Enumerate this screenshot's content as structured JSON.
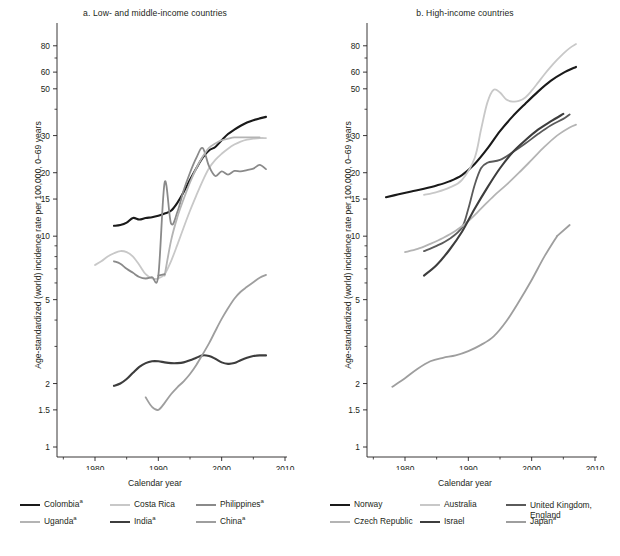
{
  "figure": {
    "width": 620,
    "height": 556,
    "background": "#ffffff",
    "ink": "#231f20"
  },
  "axis": {
    "xlabel": "Calendar year",
    "ylabel": "Age-standardized (world) incidence rate per 100,000, 0–69 years",
    "x_ticks_major": [
      1980,
      1990,
      2000,
      2010
    ],
    "x_ticks_minor": [
      1975,
      1985,
      1995,
      2005
    ],
    "x_tick_labels": [
      "1980",
      "1990",
      "2000",
      "2010"
    ],
    "xlim": [
      1974,
      2010
    ],
    "y_tick_labels": [
      "80",
      "60",
      "50",
      "30",
      "20",
      "15",
      "10",
      "5",
      "2",
      "1.5",
      "1"
    ],
    "y_ticks_major": [
      80,
      60,
      50,
      30,
      20,
      15,
      10,
      5,
      2,
      1.5,
      1
    ],
    "y_ticks_minor": [
      70,
      40,
      9,
      8,
      7,
      6,
      4,
      3
    ],
    "ylim": [
      1,
      90
    ],
    "yscale": "log",
    "grid": false
  },
  "panels": [
    {
      "id": "a",
      "title": "a. Low- and middle-income countries",
      "legend": [
        {
          "label": "Colombia",
          "superscript": "a",
          "color": "#1a1a1a",
          "width": 2.2
        },
        {
          "label": "Costa Rica",
          "superscript": "",
          "color": "#c8c8c8",
          "width": 2.0
        },
        {
          "label": "Philippines",
          "superscript": "a",
          "color": "#8a8a8a",
          "width": 2.0
        },
        {
          "label": "Uganda",
          "superscript": "a",
          "color": "#b4b4b4",
          "width": 2.0
        },
        {
          "label": "India",
          "superscript": "a",
          "color": "#3d3d3d",
          "width": 2.2
        },
        {
          "label": "China",
          "superscript": "a",
          "color": "#9e9e9e",
          "width": 2.0
        }
      ]
    },
    {
      "id": "b",
      "title": "b. High-income countries",
      "legend": [
        {
          "label": "Norway",
          "superscript": "",
          "color": "#1a1a1a",
          "width": 2.2
        },
        {
          "label": "Australia",
          "superscript": "",
          "color": "#c8c8c8",
          "width": 2.0
        },
        {
          "label": "United Kingdom, England",
          "superscript": "",
          "color": "#5a5a5a",
          "width": 2.0
        },
        {
          "label": "Czech Republic",
          "superscript": "",
          "color": "#b4b4b4",
          "width": 2.0
        },
        {
          "label": "Israel",
          "superscript": "",
          "color": "#3d3d3d",
          "width": 2.2
        },
        {
          "label": "Japan",
          "superscript": "a",
          "color": "#9e9e9e",
          "width": 2.0
        }
      ]
    }
  ],
  "chart_data": [
    {
      "panel": "a",
      "type": "line",
      "title": "a. Low- and middle-income countries",
      "xlabel": "Calendar year",
      "ylabel": "Age-standardized (world) incidence rate per 100,000, 0–69 years",
      "yscale": "log",
      "xlim": [
        1974,
        2010
      ],
      "ylim": [
        1,
        90
      ],
      "legend_position": "below",
      "series": [
        {
          "name": "Colombia",
          "color": "#1a1a1a",
          "x": [
            1983,
            1984,
            1985,
            1986,
            1987,
            1988,
            1989,
            1990,
            1991,
            1992,
            1993,
            1994,
            1995,
            1996,
            1997,
            1998,
            1999,
            2000,
            2001,
            2002,
            2003,
            2004,
            2005,
            2006,
            2007
          ],
          "y": [
            11.2,
            11.3,
            11.6,
            12.2,
            12.0,
            12.2,
            12.3,
            12.5,
            12.8,
            13.2,
            14.4,
            16.2,
            18.5,
            21.0,
            23.6,
            25.5,
            26.5,
            28.5,
            30.5,
            32.0,
            33.4,
            34.6,
            35.5,
            36.2,
            36.8
          ]
        },
        {
          "name": "Costa Rica",
          "color": "#c8c8c8",
          "x": [
            1980,
            1981,
            1982,
            1983,
            1984,
            1985,
            1986,
            1987,
            1988,
            1989,
            1990,
            1991,
            1992,
            1993,
            1994,
            1995,
            1996,
            1997,
            1998,
            1999,
            2000,
            2001,
            2002,
            2003,
            2004,
            2005,
            2006,
            2007
          ],
          "y": [
            7.3,
            7.6,
            8.0,
            8.3,
            8.5,
            8.4,
            8.0,
            7.3,
            6.6,
            6.3,
            6.3,
            6.6,
            7.6,
            9.1,
            11.0,
            13.2,
            15.6,
            18.3,
            21.0,
            23.0,
            24.6,
            26.0,
            27.2,
            28.1,
            28.7,
            29.0,
            29.2,
            29.2
          ]
        },
        {
          "name": "Philippines",
          "color": "#8a8a8a",
          "x": [
            1983,
            1984,
            1985,
            1986,
            1987,
            1988,
            1989,
            1990,
            1991,
            1992,
            1993,
            1994,
            1995,
            1996,
            1997,
            1998,
            1999,
            2000,
            2001,
            2002,
            2003,
            2004,
            2005,
            2006,
            2007
          ],
          "y": [
            7.6,
            7.4,
            7.0,
            6.7,
            6.4,
            6.3,
            6.4,
            6.5,
            18.0,
            11.5,
            13.0,
            16.5,
            20.0,
            23.5,
            26.2,
            21.5,
            19.3,
            20.3,
            19.6,
            20.4,
            20.3,
            20.6,
            20.9,
            21.8,
            20.8
          ]
        },
        {
          "name": "Uganda",
          "color": "#b4b4b4",
          "x": [
            1991,
            1992,
            1993,
            1994,
            1995,
            1996,
            1997,
            1998,
            1999,
            2000,
            2001,
            2002,
            2003,
            2004,
            2005,
            2006
          ],
          "y": [
            6.5,
            9.5,
            12.3,
            15.0,
            18.0,
            21.0,
            23.8,
            26.2,
            27.5,
            28.5,
            29.0,
            29.4,
            29.4,
            29.4,
            29.4,
            29.4
          ]
        },
        {
          "name": "India",
          "color": "#3d3d3d",
          "x": [
            1983,
            1984,
            1985,
            1986,
            1987,
            1988,
            1989,
            1990,
            1991,
            1992,
            1993,
            1994,
            1995,
            1996,
            1997,
            1998,
            1999,
            2000,
            2001,
            2002,
            2003,
            2004,
            2005,
            2006,
            2007
          ],
          "y": [
            1.95,
            2.0,
            2.1,
            2.25,
            2.4,
            2.5,
            2.55,
            2.55,
            2.52,
            2.5,
            2.5,
            2.52,
            2.58,
            2.65,
            2.72,
            2.7,
            2.62,
            2.52,
            2.48,
            2.5,
            2.58,
            2.65,
            2.7,
            2.72,
            2.72
          ]
        },
        {
          "name": "China",
          "color": "#9e9e9e",
          "x": [
            1988,
            1989,
            1990,
            1991,
            1992,
            1993,
            1994,
            1995,
            1996,
            1997,
            1998,
            1999,
            2000,
            2001,
            2002,
            2003,
            2004,
            2005,
            2006,
            2007
          ],
          "y": [
            1.72,
            1.55,
            1.5,
            1.62,
            1.78,
            1.92,
            2.05,
            2.22,
            2.45,
            2.75,
            3.1,
            3.55,
            4.05,
            4.55,
            5.05,
            5.45,
            5.75,
            6.05,
            6.35,
            6.55
          ]
        },
        {
          "name": "Philippines-lower",
          "color": "#8a8a8a",
          "x": [
            1990,
            1991
          ],
          "y": [
            6.5,
            6.6
          ]
        }
      ]
    },
    {
      "panel": "b",
      "type": "line",
      "title": "b. High-income countries",
      "xlabel": "Calendar year",
      "ylabel": "Age-standardized (world) incidence rate per 100,000, 0–69 years",
      "yscale": "log",
      "xlim": [
        1974,
        2010
      ],
      "ylim": [
        1,
        90
      ],
      "legend_position": "below",
      "series": [
        {
          "name": "Norway",
          "color": "#1a1a1a",
          "x": [
            1977,
            1979,
            1981,
            1983,
            1985,
            1987,
            1989,
            1991,
            1993,
            1995,
            1997,
            1999,
            2001,
            2003,
            2005,
            2007
          ],
          "y": [
            15.3,
            15.8,
            16.3,
            16.8,
            17.4,
            18.2,
            19.5,
            22.0,
            26.0,
            31.5,
            37.0,
            42.5,
            48.5,
            54.5,
            59.5,
            63.5
          ]
        },
        {
          "name": "Australia",
          "color": "#c8c8c8",
          "x": [
            1983,
            1985,
            1987,
            1989,
            1991,
            1992,
            1993,
            1994,
            1995,
            1996,
            1997,
            1998,
            1999,
            2000,
            2001,
            2002,
            2003,
            2004,
            2005,
            2006,
            2007
          ],
          "y": [
            15.7,
            16.2,
            17.0,
            18.5,
            23.5,
            32.0,
            43.0,
            49.5,
            48.0,
            44.5,
            43.5,
            43.8,
            45.5,
            49.0,
            53.5,
            58.5,
            63.5,
            68.5,
            73.5,
            78.0,
            81.5
          ]
        },
        {
          "name": "United Kingdom, England",
          "color": "#5a5a5a",
          "x": [
            1983,
            1985,
            1987,
            1989,
            1990,
            1991,
            1992,
            1993,
            1995,
            1997,
            1999,
            2001,
            2003,
            2005,
            2006
          ],
          "y": [
            8.5,
            9.0,
            9.7,
            11.0,
            13.5,
            17.5,
            21.0,
            22.3,
            23.0,
            25.0,
            27.5,
            30.5,
            33.5,
            36.0,
            37.8
          ]
        },
        {
          "name": "Czech Republic",
          "color": "#b4b4b4",
          "x": [
            1980,
            1982,
            1984,
            1986,
            1988,
            1990,
            1992,
            1994,
            1996,
            1998,
            2000,
            2002,
            2004,
            2006,
            2007
          ],
          "y": [
            8.4,
            8.7,
            9.2,
            9.8,
            10.6,
            11.8,
            13.5,
            15.5,
            17.5,
            20.0,
            23.0,
            26.5,
            30.0,
            32.8,
            33.8
          ]
        },
        {
          "name": "Israel",
          "color": "#3d3d3d",
          "x": [
            1983,
            1985,
            1987,
            1989,
            1991,
            1993,
            1995,
            1997,
            1999,
            2001,
            2003,
            2005
          ],
          "y": [
            6.5,
            7.3,
            8.6,
            10.5,
            13.5,
            17.0,
            21.0,
            25.0,
            28.5,
            32.0,
            35.0,
            38.0
          ]
        },
        {
          "name": "Japan",
          "color": "#9e9e9e",
          "x": [
            1978,
            1980,
            1982,
            1984,
            1986,
            1988,
            1990,
            1992,
            1994,
            1996,
            1998,
            2000,
            2002,
            2004
          ],
          "y": [
            1.93,
            2.12,
            2.35,
            2.55,
            2.65,
            2.72,
            2.85,
            3.05,
            3.35,
            3.95,
            4.9,
            6.2,
            8.0,
            10.0
          ]
        },
        {
          "name": "Japan-tail",
          "color": "#9e9e9e",
          "x": [
            2004,
            2006
          ],
          "y": [
            10.0,
            11.3
          ]
        }
      ]
    }
  ]
}
